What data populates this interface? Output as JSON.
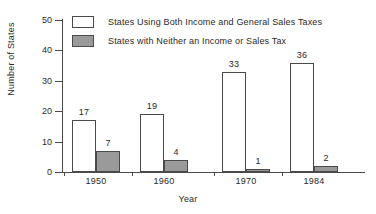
{
  "chart_data": {
    "type": "bar",
    "title": "",
    "xlabel": "Year",
    "ylabel": "Number of States",
    "categories": [
      "1950",
      "1960",
      "1970",
      "1984"
    ],
    "series": [
      {
        "name": "States Using Both Income and General Sales Taxes",
        "values": [
          17,
          19,
          33,
          36
        ],
        "color": "#ffffff",
        "style": "open"
      },
      {
        "name": "States with Neither an Income or Sales Tax",
        "values": [
          7,
          4,
          1,
          2
        ],
        "color": "#9a9a9a",
        "style": "filled"
      }
    ],
    "ylim": [
      0,
      50
    ],
    "yticks": [
      0,
      10,
      20,
      30,
      40,
      50
    ],
    "grid": false,
    "legend_position": "top-left",
    "axis_color": "#4a4a4a"
  },
  "legend": {
    "items": [
      {
        "label": "States Using Both Income and General Sales Taxes",
        "style": "open"
      },
      {
        "label": "States with Neither an Income or Sales Tax",
        "style": "filled"
      }
    ]
  }
}
